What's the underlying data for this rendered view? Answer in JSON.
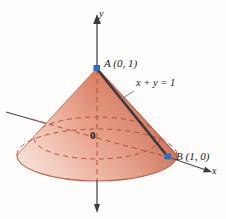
{
  "figure": {
    "kind": "3d-cone-diagram",
    "background_color": "#fefdfc",
    "labels": {
      "point_a": "A (0, 1)",
      "point_b": "B (1, 0)",
      "line_equation": "x + y = 1",
      "axis_y": "y",
      "axis_x": "x",
      "origin": "0"
    },
    "colors": {
      "cone_light": "#f3c9bb",
      "cone_mid": "#e3917a",
      "cone_dark": "#c4654a",
      "cone_edge": "#b9563c",
      "marker": "#2a6fc4",
      "axis": "#4a4a4a",
      "segment": "#3a3a3a",
      "dashed": "#b3503a"
    },
    "geometry": {
      "apex_x": 97,
      "apex_y": 68,
      "point_b_x": 168,
      "point_b_y": 157,
      "origin_x": 97,
      "origin_y": 138,
      "base_rx": 80,
      "base_ry": 26,
      "base_cy": 157
    }
  }
}
